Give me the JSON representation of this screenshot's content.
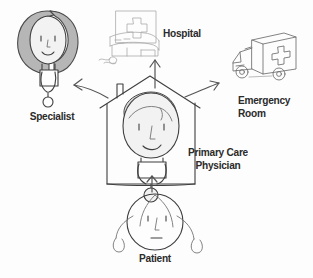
{
  "diagram": {
    "background_color": "#fdfdfd",
    "ink_color": "#3a3a3a",
    "label_color": "#2b2b2b",
    "hair_shade_color": "#b4b4b4",
    "face_shade_color": "#efefef"
  },
  "nodes": {
    "specialist": {
      "label": "Specialist",
      "icon": "specialist-doctor-figure",
      "position": "top-left"
    },
    "hospital": {
      "label": "Hospital",
      "icon": "hospital-building",
      "position": "top-center"
    },
    "emergency_room": {
      "label": "Emergency\nRoom",
      "icon": "ambulance",
      "position": "top-right"
    },
    "primary_care_physician": {
      "label": "Primary Care\nPhysician",
      "icon": "house-with-doctor",
      "position": "center"
    },
    "patient": {
      "label": "Patient",
      "icon": "patient-face-with-braids",
      "position": "bottom-center"
    }
  },
  "arrows": [
    {
      "name": "patient-to-physician",
      "from": "patient",
      "to": "primary_care_physician",
      "direction": "up"
    },
    {
      "name": "physician-to-specialist",
      "from": "primary_care_physician",
      "to": "specialist",
      "direction": "up-left"
    },
    {
      "name": "physician-to-hospital",
      "from": "primary_care_physician",
      "to": "hospital",
      "direction": "up"
    },
    {
      "name": "physician-to-emergency-room",
      "from": "primary_care_physician",
      "to": "emergency_room",
      "direction": "up-right"
    }
  ]
}
